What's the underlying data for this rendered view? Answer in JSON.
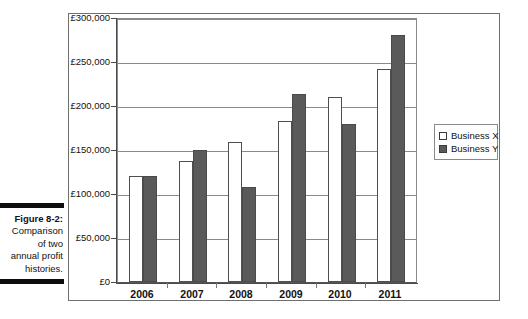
{
  "caption": {
    "figure_label": "Figure 8-2:",
    "lines": [
      "Comparison",
      "of two",
      "annual profit",
      "histories."
    ]
  },
  "legend": {
    "position": "right",
    "items": [
      {
        "label": "Business X",
        "swatch": "open-square-swatch",
        "color": "#ffffff"
      },
      {
        "label": "Business Y",
        "swatch": "filled-square-swatch",
        "color": "#5a5a5a"
      }
    ]
  },
  "chart_data": {
    "type": "bar",
    "title": "",
    "subtitle": "",
    "xlabel": "",
    "ylabel": "",
    "categories": [
      "2006",
      "2007",
      "2008",
      "2009",
      "2010",
      "2011"
    ],
    "series": [
      {
        "name": "Business X",
        "color": "#ffffff",
        "values": [
          120000,
          138000,
          159000,
          183000,
          210000,
          242000
        ]
      },
      {
        "name": "Business Y",
        "color": "#5a5a5a",
        "values": [
          120000,
          150000,
          108000,
          214000,
          179000,
          281000
        ]
      }
    ],
    "ylim": [
      0,
      300000
    ],
    "ytick_values": [
      300000,
      250000,
      200000,
      150000,
      100000,
      50000,
      0
    ],
    "ytick_labels": [
      "£300,000",
      "£250,000",
      "£200,000",
      "£150,000",
      "£100,000",
      "£50,000",
      "£0"
    ],
    "grid": true,
    "legend_position": "right",
    "currency": "£"
  }
}
